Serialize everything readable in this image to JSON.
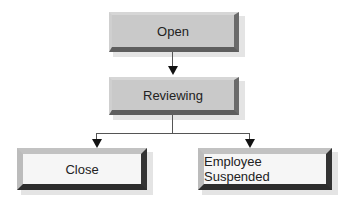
{
  "diagram": {
    "type": "flowchart",
    "nodes": [
      {
        "id": "open",
        "label": "Open",
        "style": "gray"
      },
      {
        "id": "reviewing",
        "label": "Reviewing",
        "style": "gray"
      },
      {
        "id": "close",
        "label": "Close",
        "style": "light"
      },
      {
        "id": "employee_suspended",
        "label": "Employee Suspended",
        "style": "light"
      }
    ],
    "edges": [
      {
        "from": "open",
        "to": "reviewing"
      },
      {
        "from": "reviewing",
        "to": "close"
      },
      {
        "from": "reviewing",
        "to": "employee_suspended"
      }
    ]
  },
  "colors": {
    "gray_node": "#c8c8c8",
    "light_node": "#f6f6f6",
    "dark_bevel": "#333333",
    "connector": "#555555"
  }
}
